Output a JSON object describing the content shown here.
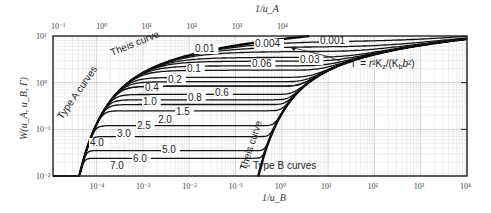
{
  "chart_data": {
    "type": "line",
    "title": "",
    "ylabel": "W(u_A, u_B, Γ)",
    "xlabel_top": "1/u_A",
    "xlabel_bottom": "1/u_B",
    "xscale": "log",
    "yscale": "log",
    "ylim": [
      0.01,
      10
    ],
    "xlim_top": [
      0.08,
      10000
    ],
    "xlim_bottom": [
      1.15e-05,
      10000
    ],
    "grid": true,
    "top_ticks": [
      "10⁻¹",
      "10⁰",
      "10¹",
      "10²",
      "10³",
      "10⁴"
    ],
    "bottom_ticks": [
      "10⁻⁴",
      "10⁻³",
      "10⁻²",
      "10⁻¹",
      "10⁰",
      "10¹",
      "10²",
      "10³",
      "10⁴"
    ],
    "y_ticks": [
      "10⁻²",
      "10⁻¹",
      "10⁰",
      "10¹"
    ],
    "annotations": {
      "theis_a": "Theis curve",
      "type_a": "Type A curves",
      "theis_b": "Theis curve",
      "type_b": "Type B curves",
      "gamma": "Γ = r²K_z/(K_b b²)"
    },
    "series": [
      {
        "name": "0.001",
        "plateau": 8.0,
        "label_x": 320,
        "label_y": 44
      },
      {
        "name": "0.004",
        "plateau": 6.0,
        "label_x": 255,
        "label_y": 47
      },
      {
        "name": "0.01",
        "plateau": 4.7,
        "label_x": 195,
        "label_y": 52
      },
      {
        "name": "0.03",
        "plateau": 3.5,
        "label_x": 300,
        "label_y": 63
      },
      {
        "name": "0.06",
        "plateau": 2.9,
        "label_x": 252,
        "label_y": 67
      },
      {
        "name": "0.1",
        "plateau": 2.3,
        "label_x": 187,
        "label_y": 72
      },
      {
        "name": "0.2",
        "plateau": 1.85,
        "label_x": 168,
        "label_y": 83
      },
      {
        "name": "0.4",
        "plateau": 1.3,
        "label_x": 145,
        "label_y": 91
      },
      {
        "name": "0.6",
        "plateau": 1.05,
        "label_x": 215,
        "label_y": 96
      },
      {
        "name": "0.8",
        "plateau": 0.84,
        "label_x": 188,
        "label_y": 101
      },
      {
        "name": "1.0",
        "plateau": 0.84,
        "label_x": 143,
        "label_y": 105
      },
      {
        "name": "1.5",
        "plateau": 0.56,
        "label_x": 176,
        "label_y": 115
      },
      {
        "name": "2.0",
        "plateau": 0.43,
        "label_x": 158,
        "label_y": 123
      },
      {
        "name": "2.5",
        "plateau": 0.34,
        "label_x": 137,
        "label_y": 129
      },
      {
        "name": "3.0",
        "plateau": 0.25,
        "label_x": 117,
        "label_y": 137
      },
      {
        "name": "4.0",
        "plateau": 0.12,
        "label_x": 90,
        "label_y": 146
      },
      {
        "name": "5.0",
        "plateau": 0.07,
        "label_x": 162,
        "label_y": 153
      },
      {
        "name": "6.0",
        "plateau": 0.035,
        "label_x": 133,
        "label_y": 162
      },
      {
        "name": "7.0",
        "plateau": 0.024,
        "label_x": 110,
        "label_y": 169
      }
    ]
  }
}
